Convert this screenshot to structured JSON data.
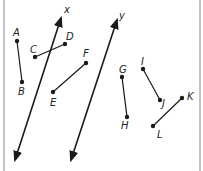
{
  "diagram": {
    "colors": {
      "line": "#1a1a1a",
      "border": "#b0b0b0",
      "label": "#222222"
    },
    "lines": [
      {
        "name": "x",
        "label": "x",
        "from": [
          15,
          160
        ],
        "to": [
          61,
          18
        ],
        "label_pos": [
          64,
          13
        ]
      },
      {
        "name": "y",
        "label": "y",
        "from": [
          71,
          160
        ],
        "to": [
          117,
          20
        ],
        "label_pos": [
          119,
          19
        ]
      }
    ],
    "segments": [
      {
        "id": "AB",
        "p1": {
          "label": "A",
          "pt": [
            17,
            41
          ],
          "label_pos": [
            13,
            36
          ]
        },
        "p2": {
          "label": "B",
          "pt": [
            22,
            82
          ],
          "label_pos": [
            18,
            95
          ]
        }
      },
      {
        "id": "CD",
        "p1": {
          "label": "C",
          "pt": [
            35,
            57
          ],
          "label_pos": [
            30,
            53
          ]
        },
        "p2": {
          "label": "D",
          "pt": [
            65,
            44
          ],
          "label_pos": [
            66,
            40
          ]
        }
      },
      {
        "id": "EF",
        "p1": {
          "label": "E",
          "pt": [
            53,
            92
          ],
          "label_pos": [
            50,
            106
          ]
        },
        "p2": {
          "label": "F",
          "pt": [
            86,
            63
          ],
          "label_pos": [
            83,
            57
          ]
        }
      },
      {
        "id": "GH",
        "p1": {
          "label": "G",
          "pt": [
            122,
            77
          ],
          "label_pos": [
            119,
            73
          ]
        },
        "p2": {
          "label": "H",
          "pt": [
            127,
            117
          ],
          "label_pos": [
            121,
            129
          ]
        }
      },
      {
        "id": "IJ",
        "p1": {
          "label": "I",
          "pt": [
            143,
            69
          ],
          "label_pos": [
            141,
            65
          ]
        },
        "p2": {
          "label": "J",
          "pt": [
            160,
            100
          ],
          "label_pos": [
            162,
            107
          ]
        }
      },
      {
        "id": "KL",
        "p1": {
          "label": "K",
          "pt": [
            182,
            98
          ],
          "label_pos": [
            187,
            100
          ]
        },
        "p2": {
          "label": "L",
          "pt": [
            153,
            126
          ],
          "label_pos": [
            157,
            138
          ]
        }
      }
    ]
  }
}
